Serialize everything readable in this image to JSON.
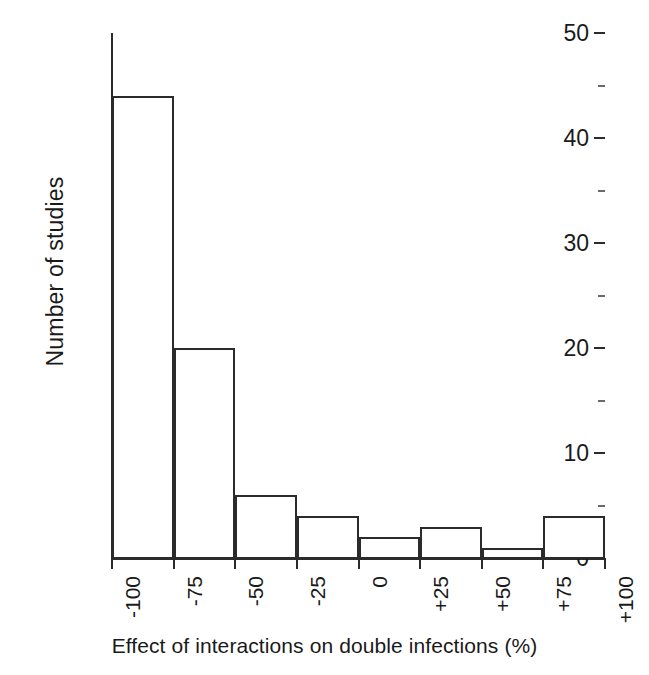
{
  "chart_data": {
    "type": "bar",
    "title": "",
    "subtitle": "",
    "xlabel": "Effect of interactions on double infections (%)",
    "ylabel": "Number of studies",
    "categories": [
      "-100 to -75",
      "-75 to -50",
      "-50 to -25",
      "-25 to 0",
      "0 to +25",
      "+25 to +50",
      "+50 to +75",
      "+75 to +100"
    ],
    "bin_edges": [
      -100,
      -75,
      -50,
      -25,
      0,
      25,
      50,
      75,
      100
    ],
    "values": [
      44,
      20,
      6,
      4,
      2,
      3,
      1,
      4
    ],
    "xlim": [
      -100,
      100
    ],
    "ylim": [
      0,
      50
    ],
    "x_tick_labels": [
      "-100",
      "-75",
      "-50",
      "-25",
      "0",
      "+25",
      "+50",
      "+75",
      "+100"
    ],
    "x_tick_values": [
      -100,
      -75,
      -50,
      -25,
      0,
      25,
      50,
      75,
      100
    ],
    "y_tick_labels": [
      "0",
      "10",
      "20",
      "30",
      "40",
      "50"
    ],
    "y_tick_values": [
      0,
      10,
      20,
      30,
      40,
      50
    ],
    "y_minor_tick_values": [
      5,
      15,
      25,
      35,
      45
    ],
    "grid": false,
    "legend": null,
    "bar_fill_color": "#ffffff",
    "bar_edge_color": "#2b2b2b",
    "axis_color": "#2b2b2b",
    "background_color": "#ffffff",
    "total_studies": 84
  }
}
